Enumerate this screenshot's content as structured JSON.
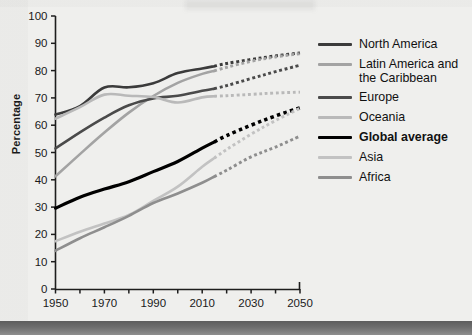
{
  "axis": {
    "ylabel": "Percentage",
    "yticks": [
      0,
      10,
      20,
      30,
      40,
      50,
      60,
      70,
      80,
      90,
      100
    ],
    "xticks": [
      1950,
      1970,
      1990,
      2010,
      2030,
      2050
    ],
    "xminor": [
      1960,
      1980,
      2000,
      2020,
      2040
    ]
  },
  "legend": {
    "items": [
      {
        "label": "North America",
        "color": "#3b3b3b",
        "bold": false,
        "width": 2.6
      },
      {
        "label": "Latin America and the Caribbean",
        "color": "#a3a3a3",
        "bold": false,
        "width": 2.6
      },
      {
        "label": "Europe",
        "color": "#4a4a4a",
        "bold": false,
        "width": 2.6
      },
      {
        "label": "Oceania",
        "color": "#b9b9b9",
        "bold": false,
        "width": 2.6
      },
      {
        "label": "Global average",
        "color": "#000000",
        "bold": true,
        "width": 3.2
      },
      {
        "label": "Asia",
        "color": "#c2c2c2",
        "bold": false,
        "width": 2.6
      },
      {
        "label": "Africa",
        "color": "#8e8e8e",
        "bold": false,
        "width": 2.6
      }
    ]
  },
  "chart_data": {
    "type": "line",
    "title": "",
    "xlabel": "",
    "ylabel": "Percentage",
    "xlim": [
      1950,
      2050
    ],
    "ylim": [
      0,
      100
    ],
    "grid": false,
    "legend_position": "right",
    "projection_note": "Solid segments are historical estimates through 2015; dotted segments are projections 2015-2050",
    "projection_start_year": 2015,
    "x": [
      1950,
      1960,
      1970,
      1980,
      1990,
      2000,
      2010,
      2015,
      2020,
      2030,
      2040,
      2050
    ],
    "series": [
      {
        "name": "North America",
        "color": "#3b3b3b",
        "values": [
          63.9,
          67.0,
          73.8,
          73.9,
          75.4,
          79.1,
          80.8,
          81.6,
          82.6,
          84.1,
          85.4,
          86.5
        ]
      },
      {
        "name": "Latin America and the Caribbean",
        "color": "#a3a3a3",
        "values": [
          41.3,
          49.4,
          57.3,
          64.6,
          70.7,
          75.5,
          78.8,
          79.9,
          81.2,
          83.4,
          85.0,
          86.2
        ]
      },
      {
        "name": "Europe",
        "color": "#4a4a4a",
        "values": [
          51.5,
          57.4,
          62.8,
          67.3,
          69.8,
          70.8,
          72.6,
          73.4,
          74.5,
          77.1,
          79.6,
          82.0
        ]
      },
      {
        "name": "Oceania",
        "color": "#b9b9b9",
        "values": [
          62.4,
          66.6,
          71.2,
          70.8,
          70.3,
          68.3,
          70.2,
          70.6,
          70.8,
          71.3,
          71.8,
          72.1
        ]
      },
      {
        "name": "Global average",
        "color": "#000000",
        "values": [
          29.6,
          33.6,
          36.6,
          39.3,
          43.0,
          46.7,
          51.6,
          53.9,
          56.2,
          60.0,
          63.4,
          66.4
        ]
      },
      {
        "name": "Asia",
        "color": "#c2c2c2",
        "values": [
          17.5,
          21.0,
          24.0,
          27.1,
          32.3,
          37.5,
          44.8,
          48.0,
          51.1,
          56.7,
          61.7,
          66.2
        ]
      },
      {
        "name": "Africa",
        "color": "#8e8e8e",
        "values": [
          14.0,
          18.6,
          22.6,
          26.8,
          31.5,
          35.0,
          38.9,
          41.2,
          43.5,
          48.4,
          52.0,
          56.0
        ]
      }
    ]
  }
}
